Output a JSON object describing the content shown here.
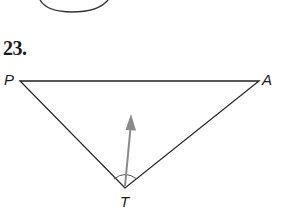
{
  "problem": {
    "number": "23."
  },
  "triangle": {
    "vertices": [
      {
        "label": "P",
        "x": 20,
        "y": 81
      },
      {
        "label": "A",
        "x": 259,
        "y": 81
      },
      {
        "label": "T",
        "x": 125,
        "y": 188
      }
    ],
    "stroke_color": "#222222"
  },
  "arrow": {
    "from": {
      "x": 125,
      "y": 186
    },
    "to": {
      "x": 131,
      "y": 117
    },
    "color": "#8a8a8a"
  },
  "angle_mark": {
    "vertex": "T",
    "radius": 14
  },
  "circle_fragment": {
    "center_x": 75,
    "center_y": -28,
    "radius_x": 40,
    "radius_y": 40
  }
}
